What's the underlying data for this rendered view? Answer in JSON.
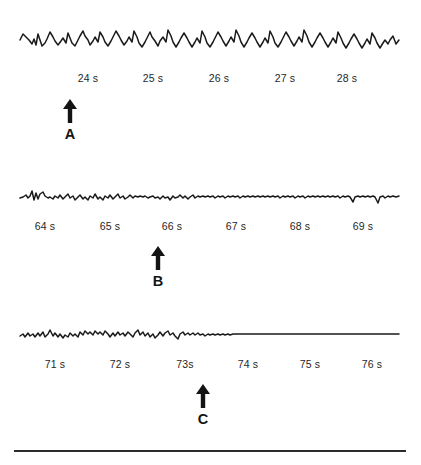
{
  "figure": {
    "background_color": "#ffffff",
    "ink_color": "#1a1a1a",
    "rule_color": "#2b2b2b",
    "panels": [
      {
        "id": "panel-a",
        "marker_letter": "A",
        "marker_x": 70,
        "arrow_icon": "arrow-up-icon",
        "tick_labels": [
          "24 s",
          "25 s",
          "26 s",
          "27 s",
          "28 s"
        ],
        "tick_positions": [
          88,
          153,
          219,
          285,
          347
        ],
        "trace": {
          "name": "trace-a",
          "description": "high-amplitude rhythmic oscillation",
          "x_start": 20,
          "x_end": 399,
          "baseline_y": 30,
          "amplitude": 14,
          "points": "20,30 23,24 26,27 29,30 32,34 34,29 36,35 38,24 40,30 42,36 45,33 47,29 50,22 53,27 55,31 58,35 61,31 63,28 66,33 68,23 70,28 72,33 75,36 78,30 80,26 83,21 85,26 88,30 90,35 93,31 95,27 98,32 100,22 103,27 105,32 108,36 111,31 113,27 116,21 119,26 121,30 124,35 127,31 129,27 132,32 134,21 137,27 139,33 142,37 145,32 147,28 150,22 152,27 155,31 158,36 160,31 163,27 166,32 168,20 171,26 173,32 176,37 179,32 181,28 184,23 187,28 189,32 192,37 195,32 197,28 200,33 202,21 205,27 207,33 210,37 213,32 215,28 218,22 221,27 223,31 226,36 229,31 231,27 234,32 236,20 239,26 241,32 244,37 247,32 249,28 252,23 255,28 257,32 260,37 263,32 265,28 268,33 270,21 273,27 275,33 278,37 281,32 283,28 286,22 289,27 291,31 294,36 297,31 299,27 302,32 304,20 307,26 309,32 312,37 315,32 317,28 320,23 323,28 325,32 328,37 331,32 333,28 336,33 338,22 341,28 343,33 346,38 349,33 351,29 354,24 357,29 359,33 362,38 365,33 367,29 370,34 372,23 375,28 377,33 380,38 383,33 385,30 388,34 390,30 393,26 396,34 399,30"
        }
      },
      {
        "id": "panel-b",
        "marker_letter": "B",
        "marker_x": 158,
        "arrow_icon": "arrow-up-icon",
        "tick_labels": [
          "64 s",
          "65 s",
          "66 s",
          "67 s",
          "68 s",
          "69 s"
        ],
        "tick_positions": [
          45,
          110,
          172,
          236,
          300,
          363
        ],
        "trace": {
          "name": "trace-b",
          "description": "low-amplitude irregular noise, quieting to the right",
          "x_start": 20,
          "x_end": 399,
          "baseline_y": 17,
          "amplitude": 5,
          "points": "20,18 23,17 26,15 28,18 30,16 32,11 34,20 36,13 38,19 40,14 43,12 45,16 48,18 50,17 53,19 55,16 58,18 60,15 63,19 65,17 68,14 70,18 73,16 75,20 78,17 80,15 83,19 85,17 88,20 90,16 93,18 95,14 98,19 100,17 103,20 105,16 108,18 110,15 113,19 115,17 118,14 120,18 123,16 125,19 128,17 130,15 133,18 135,16 138,17 140,16 143,17 145,16 148,18 150,17 153,16 155,18 158,17 160,19 163,16 165,18 168,17 170,20 173,16 175,18 178,17 180,15 183,18 185,16 188,19 190,17 193,15 195,18 198,16 200,17 203,16 205,17 208,16 210,17 213,16 215,18 218,16 220,17 223,16 225,18 228,16 230,17 233,16 235,17 238,16 240,18 243,16 245,17 248,16 250,17 253,16 255,17 258,16 260,17 263,16 265,17 268,16 270,17 273,16 275,17 278,16 280,18 283,16 285,17 288,16 290,17 293,16 295,18 298,16 300,17 303,16 305,18 308,16 310,17 313,16 315,17 318,16 320,17 323,16 325,17 328,16 330,17 333,16 335,17 338,16 340,18 343,16 345,17 348,16 350,17 353,22 355,17 358,16 360,17 363,16 365,17 368,16 370,17 373,16 375,17 378,23 380,17 383,16 385,18 388,16 390,17 393,16 396,17 399,16"
        }
      },
      {
        "id": "panel-c",
        "marker_letter": "C",
        "marker_x": 203,
        "arrow_icon": "arrow-up-icon",
        "tick_labels": [
          "71 s",
          "72 s",
          "73s",
          "74 s",
          "75 s",
          "76 s"
        ],
        "tick_positions": [
          55,
          120,
          185,
          248,
          310,
          372
        ],
        "trace": {
          "name": "trace-c",
          "description": "low-amplitude activity that flattens into a near-isoelectric line",
          "x_start": 20,
          "x_end": 399,
          "baseline_y": 17,
          "amplitude": 5,
          "points": "20,18 23,16 25,19 28,15 30,18 33,16 35,19 38,15 40,18 43,14 45,19 48,16 50,12 53,18 55,15 58,19 60,16 63,20 65,17 68,19 70,15 73,18 75,16 78,19 80,14 83,17 85,13 88,16 90,14 93,17 95,13 98,16 100,14 103,17 105,13 108,16 110,19 113,15 115,18 118,14 120,17 123,15 125,18 128,14 130,16 133,19 135,15 138,12 140,17 143,14 145,18 148,15 150,19 153,16 155,20 158,17 160,14 163,18 165,15 168,13 170,17 173,15 175,18 178,21 180,16 183,14 185,17 188,15 190,17 193,15 195,17 198,15 200,17 203,16 205,18 208,16 210,17 213,16 215,17 218,16 220,17 223,16 225,17 228,16 230,17 233,16 235,16 238,16 240,16 243,16 245,16 248,16 250,16 253,16 255,16 258,16 260,16 263,16 265,16 268,16 270,16 273,16 275,16 278,16 280,16 283,16 285,16 288,16 290,16 293,16 295,16 298,16 300,16 303,16 305,16 308,16 310,16 313,16 315,16 318,16 320,16 323,16 325,16 328,16 330,16 333,16 335,16 338,16 340,16 343,16 345,16 348,16 350,16 353,16 355,16 358,16 360,16 363,16 365,16 368,16 370,16 373,16 375,16 378,16 380,16 383,16 385,16 388,16 390,16 393,16 396,16 399,16"
        }
      }
    ],
    "bottom_rule": {
      "x": 14,
      "y": 450,
      "width": 392
    },
    "footer_partial_text": ""
  }
}
